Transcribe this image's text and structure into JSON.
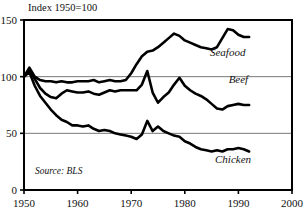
{
  "chart_data": {
    "type": "line",
    "title": "Index 1950=100",
    "xlabel": "",
    "ylabel": "",
    "xlim": [
      1950,
      2000
    ],
    "ylim": [
      0,
      150
    ],
    "grid": true,
    "gridlines_y": [
      50,
      100
    ],
    "legend_position": "inline-right-of-series",
    "source_note": "Source: BLS",
    "x_ticks": [
      "1950",
      "1960",
      "1970",
      "1980",
      "1990",
      "2000"
    ],
    "x_tick_values": [
      1950,
      1960,
      1970,
      1980,
      1990,
      2000
    ],
    "y_ticks": [
      "0",
      "50",
      "100",
      "150"
    ],
    "y_tick_values": [
      0,
      50,
      100,
      150
    ],
    "series": [
      {
        "name": "Seafood",
        "label": "Seafood",
        "label_x": 1988.0,
        "label_y": 118.0,
        "x": [
          1950,
          1951,
          1952,
          1953,
          1954,
          1955,
          1956,
          1957,
          1958,
          1959,
          1960,
          1961,
          1962,
          1963,
          1964,
          1965,
          1966,
          1967,
          1968,
          1969,
          1970,
          1971,
          1972,
          1973,
          1974,
          1975,
          1976,
          1977,
          1978,
          1979,
          1980,
          1981,
          1982,
          1983,
          1984,
          1985,
          1986,
          1987,
          1988,
          1989,
          1990,
          1991,
          1992
        ],
        "values": [
          100,
          108,
          100,
          97,
          96,
          96,
          95,
          96,
          95,
          95,
          96,
          96,
          96,
          97,
          95,
          96,
          97,
          96,
          96,
          97,
          103,
          111,
          118,
          122,
          123,
          126,
          130,
          134,
          138,
          136,
          132,
          130,
          128,
          126,
          125,
          124,
          126,
          134,
          142,
          141,
          137,
          135,
          135
        ]
      },
      {
        "name": "Beef",
        "label": "Beef",
        "label_x": 1990.0,
        "label_y": 94.0,
        "x": [
          1950,
          1951,
          1952,
          1953,
          1954,
          1955,
          1956,
          1957,
          1958,
          1959,
          1960,
          1961,
          1962,
          1963,
          1964,
          1965,
          1966,
          1967,
          1968,
          1969,
          1970,
          1971,
          1972,
          1973,
          1974,
          1975,
          1976,
          1977,
          1978,
          1979,
          1980,
          1981,
          1982,
          1983,
          1984,
          1985,
          1986,
          1987,
          1988,
          1989,
          1990,
          1991,
          1992
        ],
        "values": [
          100,
          106,
          98,
          90,
          85,
          82,
          81,
          85,
          88,
          87,
          86,
          86,
          87,
          85,
          84,
          86,
          88,
          87,
          88,
          88,
          88,
          88,
          93,
          105,
          86,
          77,
          82,
          86,
          93,
          99,
          92,
          88,
          85,
          83,
          80,
          76,
          72,
          71,
          74,
          75,
          76,
          75,
          75
        ]
      },
      {
        "name": "Chicken",
        "label": "Chicken",
        "label_x": 1989.0,
        "label_y": 24.0,
        "x": [
          1950,
          1951,
          1952,
          1953,
          1954,
          1955,
          1956,
          1957,
          1958,
          1959,
          1960,
          1961,
          1962,
          1963,
          1964,
          1965,
          1966,
          1967,
          1968,
          1969,
          1970,
          1971,
          1972,
          1973,
          1974,
          1975,
          1976,
          1977,
          1978,
          1979,
          1980,
          1981,
          1982,
          1983,
          1984,
          1985,
          1986,
          1987,
          1988,
          1989,
          1990,
          1991,
          1992
        ],
        "values": [
          100,
          104,
          92,
          83,
          77,
          71,
          66,
          62,
          60,
          57,
          57,
          56,
          57,
          54,
          52,
          53,
          52,
          50,
          49,
          48,
          47,
          45,
          49,
          61,
          52,
          56,
          52,
          50,
          48,
          47,
          43,
          41,
          38,
          36,
          35,
          34,
          35,
          34,
          36,
          36,
          37,
          36,
          34
        ]
      }
    ]
  }
}
